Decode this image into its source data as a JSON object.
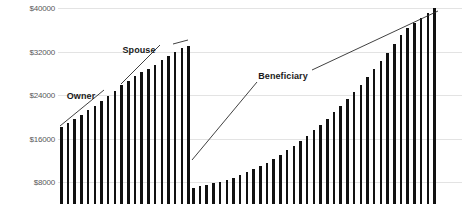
{
  "chart_data": {
    "type": "bar",
    "title": "",
    "xlabel": "",
    "ylabel": "",
    "ylim": [
      4000,
      41500
    ],
    "grid": true,
    "legend_position": "none",
    "yticks": [
      {
        "label": "$40000",
        "value": 40000
      },
      {
        "label": "$32000",
        "value": 32000
      },
      {
        "label": "$24000",
        "value": 24000
      },
      {
        "label": "$16000",
        "value": 16000
      },
      {
        "label": "$8000",
        "value": 8000
      }
    ],
    "annotations": [
      {
        "text": "Owner",
        "x": 81,
        "y": 96
      },
      {
        "text": "Spouse",
        "x": 139,
        "y": 50
      },
      {
        "text": "Beneficiary",
        "x": 283,
        "y": 76
      }
    ],
    "leader_lines": [
      {
        "x1": 60,
        "y1": 126,
        "x2": 104,
        "y2": 90
      },
      {
        "x1": 121,
        "y1": 84,
        "x2": 160,
        "y2": 45
      },
      {
        "x1": 173,
        "y1": 44,
        "x2": 188,
        "y2": 40
      },
      {
        "x1": 192,
        "y1": 160,
        "x2": 257,
        "y2": 82
      },
      {
        "x1": 312,
        "y1": 70,
        "x2": 438,
        "y2": 11
      }
    ],
    "series": [
      {
        "name": "Owner/Spouse",
        "x_start": 60,
        "values": [
          18100,
          18900,
          19600,
          20400,
          21200,
          22000,
          22900,
          23800,
          24800,
          25800,
          26700,
          27500,
          28200,
          28900,
          29600,
          30400,
          31200,
          31900,
          32600,
          33100
        ]
      },
      {
        "name": "Beneficiary",
        "x_start": 192,
        "values": [
          7000,
          7250,
          7500,
          7800,
          8100,
          8450,
          8850,
          9300,
          9800,
          10350,
          10950,
          11600,
          12300,
          13050,
          13850,
          14700,
          15600,
          16550,
          17550,
          18600,
          19700,
          20850,
          22050,
          23300,
          24600,
          25950,
          27350,
          28800,
          30300,
          31850,
          33450,
          35100,
          36350,
          37300,
          38200,
          39100,
          40000
        ]
      }
    ],
    "bar_pitch": 6.7,
    "bar_width": 2.6,
    "bar_color": "#111111",
    "grid_color": "#e3e3e3",
    "background_color": "#ffffff",
    "tick_label_color": "#58585a"
  }
}
